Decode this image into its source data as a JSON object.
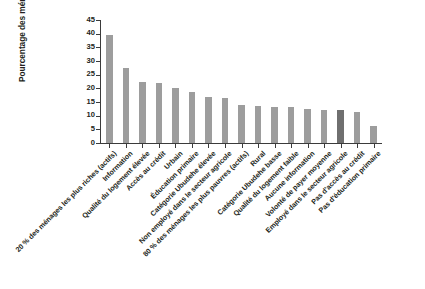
{
  "chart_data": {
    "type": "bar",
    "title": "",
    "xlabel": "",
    "ylabel": "Pourcentage des ménages",
    "ylim": [
      0,
      45
    ],
    "yticks": [
      0,
      5,
      10,
      15,
      20,
      25,
      30,
      35,
      40,
      45
    ],
    "grid": false,
    "legend": false,
    "bar_color": "#9d9d9d",
    "highlight_color": "#6f6f6f",
    "highlight_index": 14,
    "categories": [
      "20 % des ménages les plus riches (actifs)",
      "Information",
      "Qualité du logement élevée",
      "Accès au crédit",
      "Urbain",
      "Éducation primaire",
      "Catégorie Ubudehe élevée",
      "Non employé dans le secteur agricole",
      "80 % des ménages les plus pauvres (actifs)",
      "Rural",
      "Catégorie Ubudehe basse",
      "Qualité du logement faible",
      "Aucune information",
      "Volonté de payer moyenne",
      "Employé dans le secteur agricole",
      "Pas d'accès au crédit",
      "Pas d'éducation primaire"
    ],
    "values": [
      39.5,
      27.5,
      22.2,
      22.0,
      20.2,
      18.6,
      17.0,
      16.5,
      13.8,
      13.5,
      13.2,
      13.0,
      12.5,
      12.2,
      12.0,
      11.2,
      6.2
    ]
  }
}
